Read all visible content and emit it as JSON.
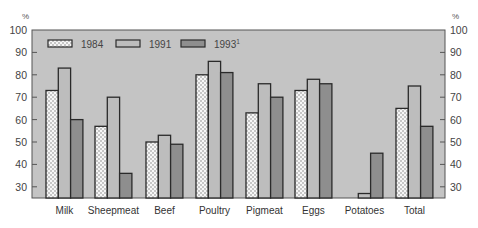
{
  "chart_data": {
    "type": "bar",
    "title": "",
    "xlabel": "",
    "ylabel": "%",
    "ylabel_right": "%",
    "ylim": [
      25,
      100
    ],
    "yticks": [
      30,
      40,
      50,
      60,
      70,
      80,
      90,
      100
    ],
    "grid": false,
    "legend_position": "top-left inside",
    "categories": [
      "Milk",
      "Sheepmeat",
      "Beef",
      "Poultry",
      "Pigmeat",
      "Eggs",
      "Potatoes",
      "Total"
    ],
    "series": [
      {
        "name": "1984",
        "style": "dotted",
        "values": [
          73,
          57,
          50,
          80,
          63,
          73,
          null,
          65
        ]
      },
      {
        "name": "1991",
        "style": "light",
        "values": [
          83,
          70,
          53,
          86,
          76,
          78,
          27,
          75
        ]
      },
      {
        "name": "1993",
        "superscript": "1",
        "style": "dark",
        "values": [
          60,
          36,
          49,
          81,
          70,
          76,
          45,
          57
        ]
      }
    ]
  },
  "colors": {
    "plot_bg": "#c4c4c4",
    "bar_1984": "#f4f4f4",
    "bar_1991": "#bdbdbd",
    "bar_1993": "#8e8e8e",
    "bar_stroke": "#2a2a2a"
  }
}
